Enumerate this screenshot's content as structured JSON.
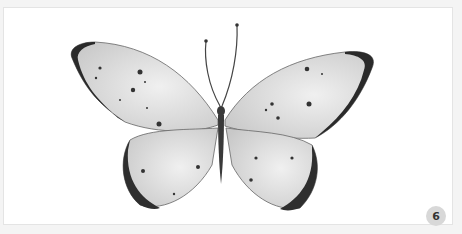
{
  "image": {
    "subject": "butterfly illustration",
    "description": "Grayscale watercolor illustration of a butterfly with pale wings, dark wing tips and scattered dark spots, viewed from above"
  },
  "badge": {
    "label": "6"
  },
  "colors": {
    "background": "#ffffff",
    "wing_fill": "#d9d9d9",
    "wing_edge": "#2a2a2a",
    "body": "#3a3a3a",
    "badge_bg": "#d8d8d8"
  }
}
